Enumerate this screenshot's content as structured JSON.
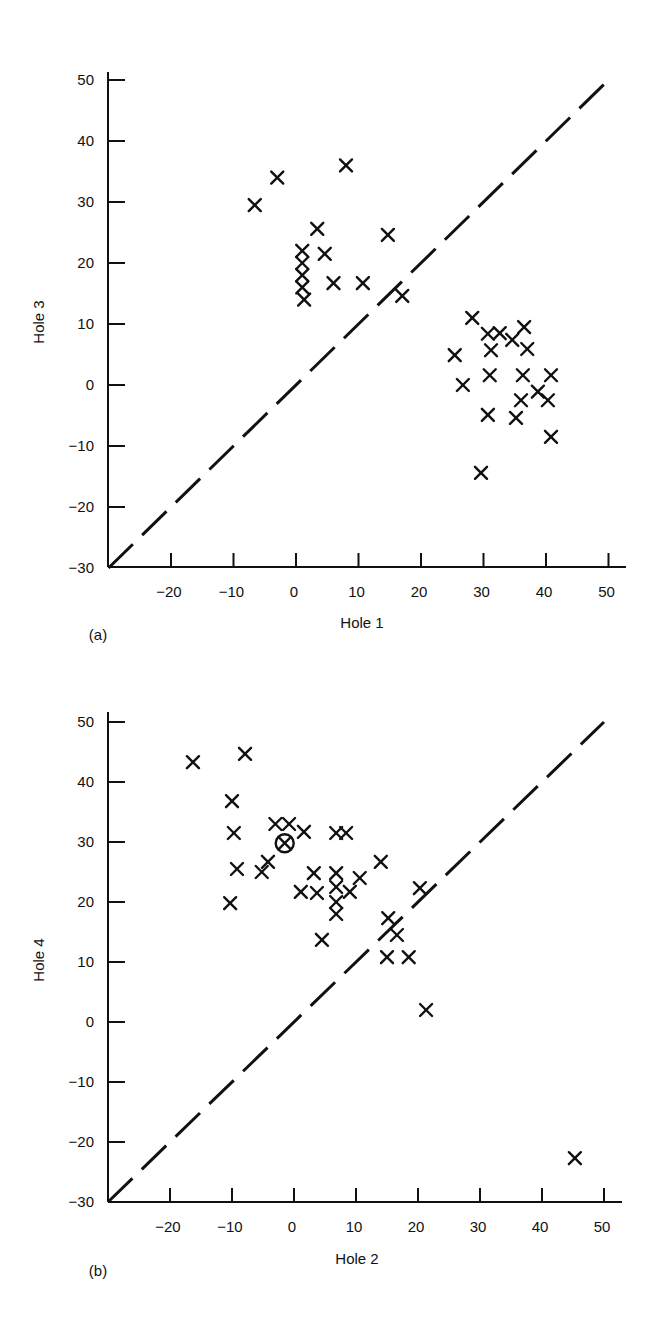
{
  "chart_data": [
    {
      "id": "a",
      "type": "scatter",
      "panel_label": "(a)",
      "title": "",
      "xlabel": "Hole 1",
      "ylabel": "Hole 3",
      "xlim": [
        -30,
        53
      ],
      "ylim": [
        -30,
        53
      ],
      "xticks": [
        -20,
        -10,
        0,
        10,
        20,
        30,
        40,
        50
      ],
      "yticks": [
        -30,
        -20,
        -10,
        0,
        10,
        20,
        30,
        40,
        50
      ],
      "grid": false,
      "legend": null,
      "marker": "x",
      "reference_line": {
        "type": "dashed",
        "from": [
          -30,
          -30
        ],
        "to": [
          50,
          50
        ],
        "label": "y = x"
      },
      "points": [
        {
          "x": -6.6,
          "y": 29.5
        },
        {
          "x": -3.0,
          "y": 34.0
        },
        {
          "x": 8.0,
          "y": 36.0
        },
        {
          "x": 3.4,
          "y": 25.6
        },
        {
          "x": 14.7,
          "y": 24.6
        },
        {
          "x": 1.0,
          "y": 22.0
        },
        {
          "x": 4.6,
          "y": 21.5
        },
        {
          "x": 1.0,
          "y": 20.0
        },
        {
          "x": 1.0,
          "y": 18.0
        },
        {
          "x": 1.0,
          "y": 16.0
        },
        {
          "x": 1.3,
          "y": 14.0
        },
        {
          "x": 6.0,
          "y": 16.7
        },
        {
          "x": 10.7,
          "y": 16.7
        },
        {
          "x": 17.0,
          "y": 14.6
        },
        {
          "x": 28.2,
          "y": 11.0
        },
        {
          "x": 30.7,
          "y": 8.4
        },
        {
          "x": 32.6,
          "y": 8.5
        },
        {
          "x": 31.2,
          "y": 5.7
        },
        {
          "x": 34.6,
          "y": 7.4
        },
        {
          "x": 36.5,
          "y": 9.5
        },
        {
          "x": 37.0,
          "y": 5.9
        },
        {
          "x": 25.4,
          "y": 4.9
        },
        {
          "x": 31.0,
          "y": 1.6
        },
        {
          "x": 36.3,
          "y": 1.6
        },
        {
          "x": 40.8,
          "y": 1.6
        },
        {
          "x": 26.7,
          "y": 0.0
        },
        {
          "x": 38.7,
          "y": -1.1
        },
        {
          "x": 36.0,
          "y": -2.5
        },
        {
          "x": 40.3,
          "y": -2.5
        },
        {
          "x": 30.7,
          "y": -4.9
        },
        {
          "x": 35.2,
          "y": -5.4
        },
        {
          "x": 40.8,
          "y": -8.5
        },
        {
          "x": 29.6,
          "y": -14.4
        }
      ]
    },
    {
      "id": "b",
      "type": "scatter",
      "panel_label": "(b)",
      "title": "",
      "xlabel": "Hole 2",
      "ylabel": "Hole 4",
      "xlim": [
        -30,
        53
      ],
      "ylim": [
        -30,
        53
      ],
      "xticks": [
        -20,
        -10,
        0,
        10,
        20,
        30,
        40,
        50
      ],
      "yticks": [
        -30,
        -20,
        -10,
        0,
        10,
        20,
        30,
        40,
        50
      ],
      "grid": false,
      "legend": null,
      "marker": "x",
      "reference_line": {
        "type": "dashed",
        "from": [
          -30,
          -30
        ],
        "to": [
          50,
          50
        ],
        "label": "y = x"
      },
      "points": [
        {
          "x": -16.3,
          "y": 43.3
        },
        {
          "x": -7.9,
          "y": 44.7
        },
        {
          "x": -10.0,
          "y": 36.8
        },
        {
          "x": -9.7,
          "y": 31.5
        },
        {
          "x": -9.2,
          "y": 25.5
        },
        {
          "x": -10.3,
          "y": 19.8
        },
        {
          "x": -3.0,
          "y": 33.0
        },
        {
          "x": -0.8,
          "y": 33.0
        },
        {
          "x": 1.6,
          "y": 31.7
        },
        {
          "x": -1.5,
          "y": 29.8,
          "circled": true
        },
        {
          "x": -4.2,
          "y": 26.7
        },
        {
          "x": -5.2,
          "y": 25.0
        },
        {
          "x": 6.8,
          "y": 31.5
        },
        {
          "x": 8.4,
          "y": 31.5
        },
        {
          "x": 14.0,
          "y": 26.7
        },
        {
          "x": 1.1,
          "y": 21.7
        },
        {
          "x": 3.2,
          "y": 24.8
        },
        {
          "x": 3.7,
          "y": 21.5
        },
        {
          "x": 6.8,
          "y": 24.8
        },
        {
          "x": 6.8,
          "y": 22.5
        },
        {
          "x": 6.8,
          "y": 20.0
        },
        {
          "x": 6.8,
          "y": 18.0
        },
        {
          "x": 9.0,
          "y": 21.7
        },
        {
          "x": 10.6,
          "y": 24.0
        },
        {
          "x": 4.5,
          "y": 13.7
        },
        {
          "x": 20.3,
          "y": 22.3
        },
        {
          "x": 15.2,
          "y": 17.3
        },
        {
          "x": 16.6,
          "y": 14.5
        },
        {
          "x": 15.0,
          "y": 10.8
        },
        {
          "x": 18.5,
          "y": 10.8
        },
        {
          "x": 21.3,
          "y": 2.0
        },
        {
          "x": 45.3,
          "y": -22.7
        }
      ]
    }
  ]
}
